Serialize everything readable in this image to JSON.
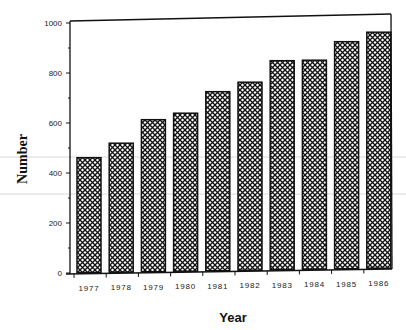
{
  "chart_data": {
    "type": "bar",
    "title": "",
    "xlabel": "Year",
    "ylabel": "Number",
    "categories": [
      "1977",
      "1978",
      "1979",
      "1980",
      "1981",
      "1982",
      "1983",
      "1984",
      "1985",
      "1986"
    ],
    "values": [
      460,
      516,
      608,
      632,
      716,
      752,
      836,
      836,
      908,
      944
    ],
    "ylim": [
      0,
      1000
    ],
    "yticks": [
      0,
      200,
      400,
      600,
      800,
      1000
    ],
    "ytick_labels": [
      "0",
      "200",
      "400",
      "600",
      "800",
      "1000"
    ],
    "minor_ytick_step": 100,
    "grid": false,
    "legend": null,
    "bar_fill": "crosshatch",
    "bar_edge_color": "#111111",
    "frame": "top-left-right-bottom box"
  },
  "colors": {
    "ink": "#111111",
    "background": "#ffffff",
    "scan_line": "#d8d8d8"
  }
}
